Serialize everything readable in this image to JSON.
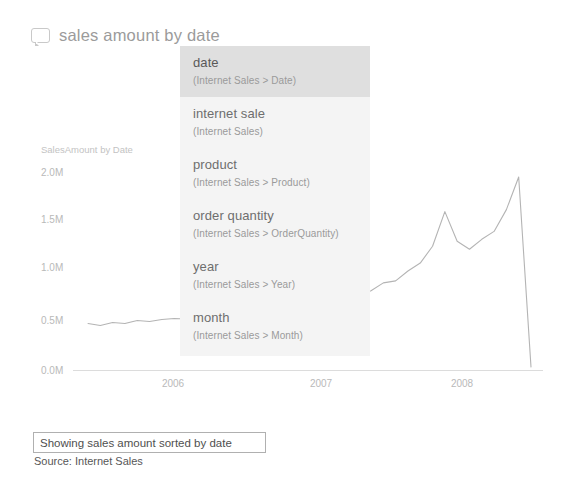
{
  "question": {
    "icon": "speech-bubble-icon",
    "text": "sales amount by date"
  },
  "suggestions": {
    "items": [
      {
        "title": "date",
        "subtitle": "(Internet Sales > Date)",
        "selected": true
      },
      {
        "title": "internet sale",
        "subtitle": "(Internet Sales)",
        "selected": false
      },
      {
        "title": "product",
        "subtitle": "(Internet Sales > Product)",
        "selected": false
      },
      {
        "title": "order quantity",
        "subtitle": "(Internet Sales > OrderQuantity)",
        "selected": false
      },
      {
        "title": "year",
        "subtitle": "(Internet Sales > Year)",
        "selected": false
      },
      {
        "title": "month",
        "subtitle": "(Internet Sales > Month)",
        "selected": false
      }
    ]
  },
  "footer": {
    "caption": "Showing sales amount sorted by date",
    "source": "Source: Internet Sales"
  },
  "chart_data": {
    "type": "line",
    "title": "SalesAmount by Date",
    "xlabel": "",
    "ylabel": "SalesAmount",
    "ylim": [
      0,
      2000000
    ],
    "grid": false,
    "legend": null,
    "y_ticks": [
      "0.0M",
      "0.5M",
      "1.0M",
      "1.5M",
      "2.0M"
    ],
    "y_tick_values": [
      0,
      500000,
      1000000,
      1500000,
      2000000
    ],
    "x_ticks": [
      "2006",
      "2007",
      "2008"
    ],
    "line_color": "#b4b4b4",
    "axis_color": "#dcdcdc",
    "series": [
      {
        "name": "SalesAmount",
        "x": [
          "2005-07",
          "2005-08",
          "2005-09",
          "2005-10",
          "2005-11",
          "2005-12",
          "2006-01",
          "2006-02",
          "2006-03",
          "2006-04",
          "2006-05",
          "2006-06",
          "2006-07",
          "2006-08",
          "2006-09",
          "2006-10",
          "2006-11",
          "2006-12",
          "2007-01",
          "2007-02",
          "2007-03",
          "2007-04",
          "2007-05",
          "2007-06",
          "2007-07",
          "2007-08",
          "2007-09",
          "2007-10",
          "2007-11",
          "2007-12",
          "2008-01",
          "2008-02",
          "2008-03",
          "2008-04",
          "2008-05",
          "2008-06",
          "2008-07"
        ],
        "values": [
          470000,
          450000,
          480000,
          470000,
          500000,
          490000,
          510000,
          520000,
          515000,
          530000,
          560000,
          600000,
          700000,
          780000,
          660000,
          610000,
          640000,
          660000,
          600000,
          590000,
          620000,
          680000,
          750000,
          800000,
          880000,
          900000,
          1000000,
          1080000,
          1250000,
          1600000,
          1300000,
          1220000,
          1320000,
          1400000,
          1620000,
          1950000,
          30000
        ]
      }
    ]
  }
}
